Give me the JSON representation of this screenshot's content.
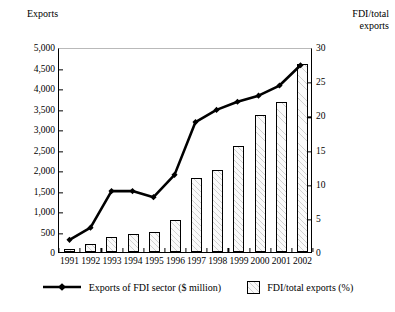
{
  "chart_data": {
    "type": "bar",
    "title": "",
    "categories": [
      "1991",
      "1992",
      "1993",
      "1994",
      "1995",
      "1996",
      "1997",
      "1998",
      "1999",
      "2000",
      "2001",
      "2002"
    ],
    "xlabel": "",
    "ylabel_left": "Exports",
    "ylabel_right": "FDI/total exports",
    "ylim_left": [
      0,
      5000
    ],
    "ylim_right": [
      0,
      30
    ],
    "ytick_labels_left": [
      "0",
      "500",
      "1,000",
      "1,500",
      "2,000",
      "2,500",
      "3,000",
      "3,500",
      "4,000",
      "4,500",
      "5,000"
    ],
    "ytick_values_left": [
      0,
      500,
      1000,
      1500,
      2000,
      2500,
      3000,
      3500,
      4000,
      4500,
      5000
    ],
    "ytick_labels_right": [
      "0",
      "5",
      "10",
      "15",
      "20",
      "25",
      "30"
    ],
    "ytick_values_right": [
      0,
      5,
      10,
      15,
      20,
      25,
      30
    ],
    "grid": false,
    "legend_position": "bottom",
    "series": [
      {
        "name": "FDI/total exports (%)",
        "type": "bar",
        "axis": "right",
        "unit": "%",
        "values": [
          0.4,
          1.1,
          2.2,
          2.6,
          3.0,
          4.7,
          10.8,
          12.0,
          15.5,
          20.0,
          22.0,
          27.5
        ]
      },
      {
        "name": "Exports of FDI sector ($ million)",
        "type": "line",
        "axis": "left",
        "unit": "$ million",
        "values": [
          300,
          600,
          1500,
          1500,
          1350,
          1900,
          3200,
          3500,
          3700,
          3850,
          4100,
          4600
        ]
      }
    ]
  },
  "axis_titles": {
    "left": "Exports",
    "right": "FDI/total\nexports"
  },
  "legend": {
    "line_label": "Exports of FDI sector ($ million)",
    "bar_label": "FDI/total exports (%)"
  }
}
